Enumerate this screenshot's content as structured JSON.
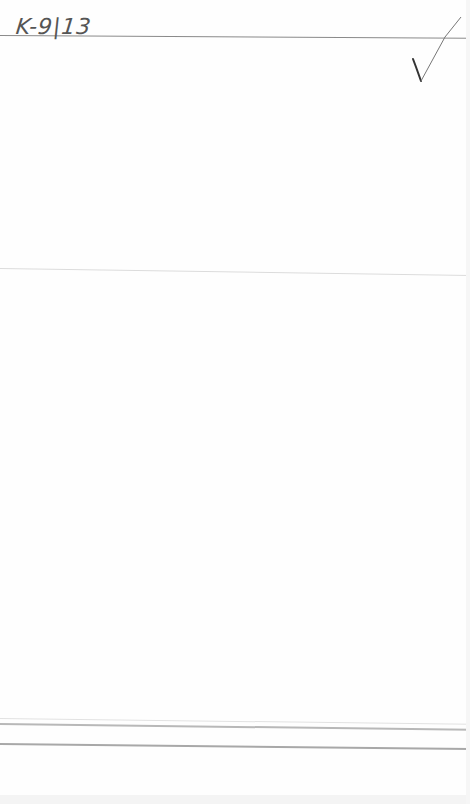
{
  "document": {
    "handwritten_code": "K-9|13",
    "check_mark": "✓",
    "colors": {
      "paper": "#fefefe",
      "ink": "#555555",
      "rule": "#8a8a8a"
    }
  }
}
